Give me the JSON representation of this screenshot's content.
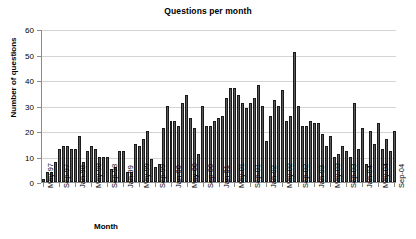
{
  "chart_data": {
    "type": "bar",
    "title": "Questions per month",
    "xlabel": "Month",
    "ylabel": "Number of questions",
    "ylim": [
      0,
      60
    ],
    "yticks": [
      0,
      10,
      20,
      30,
      40,
      50,
      60
    ],
    "grid": true,
    "legend": "none",
    "bar_color": "#595959",
    "bar_border_color": "#1a1a1a",
    "gridline_color": "#d4d4d4",
    "axis_color": "#8c8c8c",
    "tick_label_interval_months": 4,
    "categories": [
      "May-97",
      "Jun-97",
      "Jul-97",
      "Aug-97",
      "Sep-97",
      "Oct-97",
      "Nov-97",
      "Dec-97",
      "Jan-98",
      "Feb-98",
      "Mar-98",
      "Apr-98",
      "May-98",
      "Jun-98",
      "Jul-98",
      "Aug-98",
      "Sep-98",
      "Oct-98",
      "Nov-98",
      "Dec-98",
      "Jan-99",
      "Feb-99",
      "Mar-99",
      "Apr-99",
      "May-99",
      "Jun-99",
      "Jul-99",
      "Aug-99",
      "Sep-99",
      "Oct-99",
      "Nov-99",
      "Dec-99",
      "Jan-00",
      "Feb-00",
      "Mar-00",
      "Apr-00",
      "May-00",
      "Jun-00",
      "Jul-00",
      "Aug-00",
      "Sep-00",
      "Oct-00",
      "Nov-00",
      "Dec-00",
      "Jan-01",
      "Feb-01",
      "Mar-01",
      "Apr-01",
      "May-01",
      "Jun-01",
      "Jul-01",
      "Aug-01",
      "Sep-01",
      "Oct-01",
      "Nov-01",
      "Dec-01",
      "Jan-02",
      "Feb-02",
      "Mar-02",
      "Apr-02",
      "May-02",
      "Jun-02",
      "Jul-02",
      "Aug-02",
      "Sep-02",
      "Oct-02",
      "Nov-02",
      "Dec-02",
      "Jan-03",
      "Feb-03",
      "Mar-03",
      "Apr-03",
      "May-03",
      "Jun-03",
      "Jul-03",
      "Aug-03",
      "Sep-03",
      "Oct-03",
      "Nov-03",
      "Dec-03",
      "Jan-04",
      "Feb-04",
      "Mar-04",
      "Apr-04",
      "May-04",
      "Jun-04",
      "Jul-04",
      "Aug-04",
      "Sep-04"
    ],
    "values": [
      1,
      4,
      4,
      8,
      13,
      14,
      14,
      13,
      13,
      18,
      8,
      12,
      14,
      13,
      10,
      10,
      10,
      5,
      6,
      12,
      12,
      4,
      4,
      15,
      14,
      17,
      20,
      9,
      6,
      7,
      21,
      30,
      24,
      24,
      22,
      31,
      34,
      25,
      21,
      11,
      30,
      22,
      22,
      24,
      25,
      26,
      33,
      37,
      37,
      34,
      31,
      29,
      31,
      33,
      38,
      30,
      16,
      26,
      32,
      30,
      36,
      24,
      26,
      51,
      30,
      22,
      22,
      24,
      23,
      23,
      19,
      14,
      18,
      10,
      11,
      14,
      12,
      10,
      31,
      13,
      21,
      7,
      20,
      15,
      23,
      13,
      17,
      12,
      20
    ],
    "tick_labels": [
      "May-97",
      "Sep-97",
      "Jan-98",
      "May-98",
      "Sep-98",
      "Jan-99",
      "May-99",
      "Sep-99",
      "Jan-00",
      "May-00",
      "Sep-00",
      "Jan-01",
      "May-01",
      "Sep-01",
      "Jan-02",
      "May-02",
      "Sep-02",
      "Jan-03",
      "May-03",
      "Sep-03",
      "Jan-04",
      "May-04",
      "Sep-04"
    ]
  }
}
